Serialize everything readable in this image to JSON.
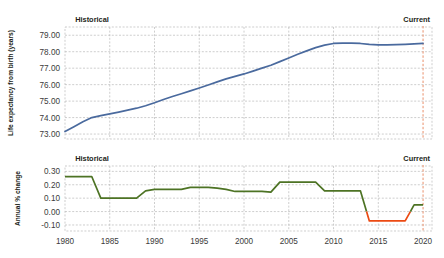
{
  "annotations": {
    "historical_label": "Historical",
    "current_label": "Current"
  },
  "colors": {
    "line_top": "#4a6a9e",
    "line_positive": "#4d7324",
    "line_negative": "#ec4a13",
    "grid": "#b9b9b9",
    "current_marker": "#e8835a",
    "axis_text": "#3b3b3b"
  },
  "chart_data": [
    {
      "type": "line",
      "title": "",
      "xlabel": "",
      "ylabel": "Life expectancy from birth (years)",
      "xlim": [
        1980,
        2021
      ],
      "ylim": [
        72.7,
        79.5
      ],
      "ytick_labels": [
        "79.00",
        "78.00",
        "77.00",
        "76.00",
        "75.00",
        "74.00",
        "73.00"
      ],
      "ytick_values": [
        79.0,
        78.0,
        77.0,
        76.0,
        75.0,
        74.0,
        73.0
      ],
      "xtick_labels": [
        "1980",
        "1985",
        "1990",
        "1995",
        "2000",
        "2005",
        "2010",
        "2015",
        "2020"
      ],
      "xtick_values": [
        1980,
        1985,
        1990,
        1995,
        2000,
        2005,
        2010,
        2015,
        2020
      ],
      "grid": true,
      "legend": "none",
      "series": [
        {
          "name": "Life expectancy at birth",
          "color": "#4a6a9e",
          "x": [
            1980,
            1981,
            1982,
            1983,
            1984,
            1985,
            1986,
            1987,
            1988,
            1989,
            1990,
            1991,
            1992,
            1993,
            1994,
            1995,
            1996,
            1997,
            1998,
            1999,
            2000,
            2001,
            2002,
            2003,
            2004,
            2005,
            2006,
            2007,
            2008,
            2009,
            2010,
            2011,
            2012,
            2013,
            2014,
            2015,
            2016,
            2017,
            2018,
            2019,
            2020
          ],
          "values": [
            73.15,
            73.45,
            73.75,
            74.0,
            74.12,
            74.22,
            74.33,
            74.45,
            74.57,
            74.72,
            74.9,
            75.1,
            75.28,
            75.45,
            75.62,
            75.8,
            75.98,
            76.17,
            76.35,
            76.5,
            76.65,
            76.82,
            77.0,
            77.18,
            77.4,
            77.62,
            77.85,
            78.05,
            78.25,
            78.4,
            78.5,
            78.52,
            78.52,
            78.5,
            78.44,
            78.42,
            78.42,
            78.43,
            78.45,
            78.48,
            78.5
          ]
        }
      ]
    },
    {
      "type": "line",
      "title": "",
      "xlabel": "",
      "ylabel": "Annual % change",
      "xlim": [
        1980,
        2021
      ],
      "ylim": [
        -0.145,
        0.34
      ],
      "ytick_labels": [
        "0.30",
        "0.20",
        "0.10",
        "0.00",
        "-0.10"
      ],
      "ytick_values": [
        0.3,
        0.2,
        0.1,
        0.0,
        -0.1
      ],
      "xtick_labels": [
        "1980",
        "1985",
        "1990",
        "1995",
        "2000",
        "2005",
        "2010",
        "2015",
        "2020"
      ],
      "xtick_values": [
        1980,
        1985,
        1990,
        1995,
        2000,
        2005,
        2010,
        2015,
        2020
      ],
      "grid": true,
      "legend": "none",
      "series": [
        {
          "name": "Annual % change",
          "x": [
            1980,
            1981,
            1982,
            1983,
            1984,
            1985,
            1986,
            1987,
            1988,
            1989,
            1990,
            1991,
            1992,
            1993,
            1994,
            1995,
            1996,
            1997,
            1998,
            1999,
            2000,
            2001,
            2002,
            2003,
            2004,
            2005,
            2006,
            2007,
            2008,
            2009,
            2010,
            2011,
            2012,
            2013,
            2014,
            2015,
            2016,
            2017,
            2018,
            2019,
            2020
          ],
          "values": [
            0.26,
            0.26,
            0.26,
            0.26,
            0.1,
            0.1,
            0.1,
            0.1,
            0.1,
            0.155,
            0.165,
            0.165,
            0.165,
            0.165,
            0.18,
            0.18,
            0.18,
            0.175,
            0.165,
            0.15,
            0.15,
            0.15,
            0.15,
            0.145,
            0.22,
            0.22,
            0.22,
            0.22,
            0.22,
            0.155,
            0.155,
            0.155,
            0.155,
            0.155,
            -0.07,
            -0.07,
            -0.07,
            -0.07,
            -0.07,
            0.05,
            0.05
          ]
        }
      ]
    }
  ]
}
